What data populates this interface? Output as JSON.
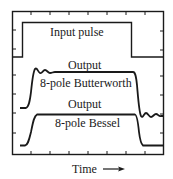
{
  "diagram": {
    "type": "pulse-response-comparison",
    "colors": {
      "ink": "#1a1a1a",
      "background": "#ffffff"
    },
    "traces": [
      {
        "id": "input",
        "label": "Input pulse"
      },
      {
        "id": "butterworth",
        "label_top": "Output",
        "label_bottom": "8-pole Butterworth"
      },
      {
        "id": "bessel",
        "label_top": "Output",
        "label_bottom": "8-pole Bessel"
      }
    ],
    "x_axis": {
      "label": "Time",
      "arrow": "→"
    }
  }
}
